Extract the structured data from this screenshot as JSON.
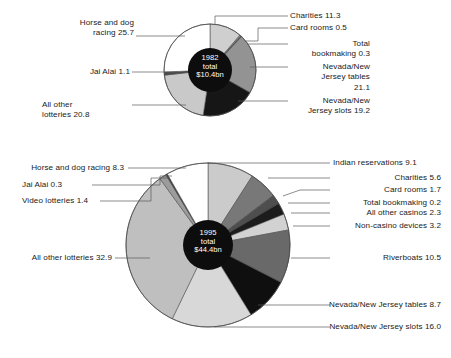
{
  "chart_data": [
    {
      "type": "pie",
      "title": "1982 total $44.4bn US gambling revenue breakdown",
      "center_label": "1982\ntotal\n$10.4bn",
      "year": "1982",
      "total": "$10.4bn",
      "unit": "percent",
      "categories": [
        "Charities",
        "Card rooms",
        "Total bookmaking",
        "Nevada/New Jersey tables",
        "Nevada/New Jersey slots",
        "All other lotteries",
        "Jai Alai",
        "Horse and dog racing"
      ],
      "values": [
        11.3,
        0.5,
        0.3,
        21.1,
        19.2,
        20.8,
        1.1,
        25.7
      ],
      "colors": [
        "#cfcfcf",
        "#8f8f8f",
        "#585858",
        "#939393",
        "#161616",
        "#c9c9c9",
        "#4a4a4a",
        "#ffffff"
      ],
      "legend": "callout-labels",
      "grid": false
    },
    {
      "type": "pie",
      "title": "1995 total $44.4bn US gambling revenue breakdown",
      "center_label": "1995\ntotal\n$44.4bn",
      "year": "1995",
      "total": "$44.4bn",
      "unit": "percent",
      "categories": [
        "Indian reservations",
        "Charities",
        "Card rooms",
        "Total bookmaking",
        "All other casinos",
        "Non-casino devices",
        "Riverboats",
        "Nevada/New Jersey tables",
        "Nevada/New Jersey slots",
        "All other lotteries",
        "Video lotteries",
        "Jai Alai",
        "Horse and dog racing"
      ],
      "values": [
        9.1,
        5.6,
        1.7,
        0.2,
        2.3,
        3.2,
        10.5,
        8.7,
        16.0,
        32.9,
        1.4,
        0.3,
        8.3
      ],
      "colors": [
        "#cbcbcb",
        "#787878",
        "#4e4e4e",
        "#2a2a2a",
        "#1c1c1c",
        "#d2d2d2",
        "#696969",
        "#0f0f0f",
        "#d8d8d8",
        "#bfbfbf",
        "#9c9c9c",
        "#3d3d3d",
        "#ffffff"
      ],
      "legend": "callout-labels",
      "grid": false
    }
  ],
  "chart_top": {
    "center": "1982\ntotal\n$10.4bn",
    "labels": {
      "horse_and_dog_racing": "Horse and dog\nracing 25.7",
      "jai_alai": "Jai Alai 1.1",
      "all_other_lotteries": "All other\nlotteries 20.8",
      "charities": "Charities 11.3",
      "card_rooms": "Card rooms 0.5",
      "total_bookmaking": "Total\nbookmaking 0.3",
      "nevada_new_jersey_tables": "Nevada/New\nJersey tables\n21.1",
      "nevada_new_jersey_slots": "Nevada/New\nJersey slots 19.2"
    }
  },
  "chart_bottom": {
    "center": "1995\ntotal\n$44.4bn",
    "labels": {
      "horse_and_dog_racing": "Horse and dog racing 8.3",
      "jai_alai": "Jai Alai 0.3",
      "video_lotteries": "Video lotteries 1.4",
      "all_other_lotteries": "All other lotteries 32.9",
      "indian_reservations": "Indian reservations 9.1",
      "charities": "Charities 5.6",
      "card_rooms": "Card rooms 1.7",
      "total_bookmaking": "Total bookmaking 0.2",
      "all_other_casinos": "All other casinos 2.3",
      "non_casino_devices": "Non-casino devices 3.2",
      "riverboats": "Riverboats 10.5",
      "nevada_new_jersey_tables": "Nevada/New Jersey tables 8.7",
      "nevada_new_jersey_slots": "Nevada/New Jersey slots 16.0"
    }
  },
  "colors": {
    "background": "#ffffff",
    "text": "#1a1a1a",
    "leader_line": "#5a5a5a",
    "center_hub": "#0d0d0d",
    "center_text": "#ffffff",
    "slice_outline": "#4a4a4a"
  }
}
